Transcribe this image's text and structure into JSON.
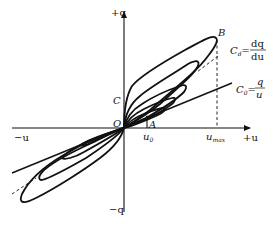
{
  "diagram": {
    "axes": {
      "x_positive": "+u",
      "x_negative": "−u",
      "y_positive": "+q",
      "y_negative": "−q",
      "origin": "O"
    },
    "points": {
      "B": "B",
      "C": "C",
      "A": "A"
    },
    "ticks": {
      "u0": "u",
      "u0_sub": "0",
      "umax": "u",
      "umax_sub": "max"
    },
    "formulas": {
      "differential": {
        "lhs": "C",
        "lhs_sub": "d",
        "eq": "=",
        "num": "dq",
        "den": "du"
      },
      "static": {
        "lhs": "C",
        "lhs_sub": "0",
        "eq": "=",
        "num": "q",
        "den": "u"
      }
    },
    "colors": {
      "ink": "#111111",
      "background": "#ffffff"
    }
  }
}
